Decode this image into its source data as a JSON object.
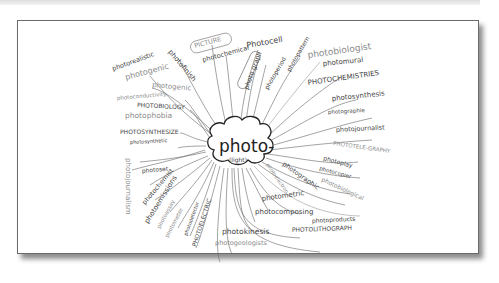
{
  "diagram": {
    "type": "mind-map",
    "center": {
      "word": "photo-",
      "meaning": "(light)"
    },
    "colors": {
      "ink": "#444444",
      "light_ink": "#8a8a8a",
      "paper": "#ffffff",
      "frame_border": "#6a6a6a"
    },
    "branches": [
      {
        "id": "b01",
        "label": "photorealistic"
      },
      {
        "id": "b02",
        "label": "photogenic"
      },
      {
        "id": "b03",
        "label": "photofinish"
      },
      {
        "id": "b04",
        "label": "PICTURE"
      },
      {
        "id": "b05",
        "label": "photochemical"
      },
      {
        "id": "b06",
        "label": "Photocell"
      },
      {
        "id": "b07",
        "label": "photo graph"
      },
      {
        "id": "b08",
        "label": "photoperiod"
      },
      {
        "id": "b09",
        "label": "photopattern"
      },
      {
        "id": "b10",
        "label": "photobiologist"
      },
      {
        "id": "b11",
        "label": "photomural"
      },
      {
        "id": "b12",
        "label": "PHOTOCHEMISTRIES"
      },
      {
        "id": "b13",
        "label": "photosynthesis"
      },
      {
        "id": "b14",
        "label": "photographie"
      },
      {
        "id": "b15",
        "label": "photojournalist"
      },
      {
        "id": "b16",
        "label": "PHOTOTELE-GRAPHY"
      },
      {
        "id": "b17",
        "label": "photoplay"
      },
      {
        "id": "b18",
        "label": "photocopier"
      },
      {
        "id": "b19",
        "label": "photobiological"
      },
      {
        "id": "b20",
        "label": "photographic"
      },
      {
        "id": "b21",
        "label": "photoelectron"
      },
      {
        "id": "b22",
        "label": "photometric"
      },
      {
        "id": "b23",
        "label": "photocomposing"
      },
      {
        "id": "b24",
        "label": "photoproducts"
      },
      {
        "id": "b25",
        "label": "PHOTOLITHOGRAPH"
      },
      {
        "id": "b26",
        "label": "photokinesis"
      },
      {
        "id": "b27",
        "label": "photogeologists"
      },
      {
        "id": "b28",
        "label": "PHOTOELECTRIC"
      },
      {
        "id": "b29",
        "label": "photodetector"
      },
      {
        "id": "b30",
        "label": "photometer"
      },
      {
        "id": "b31",
        "label": "photoassay"
      },
      {
        "id": "b32",
        "label": "photoemissions"
      },
      {
        "id": "b33",
        "label": "photochemist"
      },
      {
        "id": "b34",
        "label": "photoset"
      },
      {
        "id": "b35",
        "label": "photojournalism"
      },
      {
        "id": "b36",
        "label": "photosynthetic"
      },
      {
        "id": "b37",
        "label": "PHOTOSYNTHESIZE"
      },
      {
        "id": "b38",
        "label": "photophobia"
      },
      {
        "id": "b39",
        "label": "PHOTOBIOLOGY"
      },
      {
        "id": "b40",
        "label": "photoconductivity"
      },
      {
        "id": "b41",
        "label": "photogenic"
      }
    ]
  }
}
